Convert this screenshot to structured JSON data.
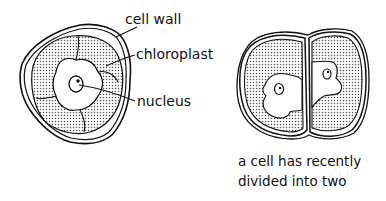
{
  "diagram": {
    "left_cell": {
      "labels": {
        "cell_wall": "cell wall",
        "chloroplast": "chloroplast",
        "nucleus": "nucleus"
      }
    },
    "right_cell": {
      "caption_line1": "a cell has recently",
      "caption_line2": "divided into two"
    }
  }
}
